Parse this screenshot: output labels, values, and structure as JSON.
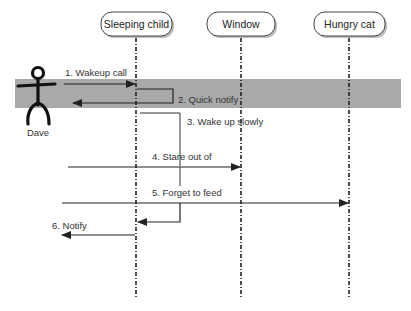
{
  "diagram": {
    "type": "sequence",
    "colors": {
      "band": "#a9a9a9",
      "line": "#222222",
      "text": "#333333",
      "box_border": "#444444",
      "box_shadow": "#bdbdbd"
    },
    "actor": {
      "name": "Dave",
      "icon": "stick-figure-icon"
    },
    "lifelines": [
      {
        "id": "child",
        "label": "Sleeping child"
      },
      {
        "id": "window",
        "label": "Window"
      },
      {
        "id": "cat",
        "label": "Hungry cat"
      }
    ],
    "messages": [
      {
        "n": 1,
        "label": "1. Wakeup call",
        "from": "Dave",
        "to": "Sleeping child"
      },
      {
        "n": 2,
        "label": "2. Quick notify",
        "from": "Sleeping child",
        "to": "Dave"
      },
      {
        "n": 3,
        "label": "3. Wake up slowly",
        "from": "Sleeping child",
        "to": "Sleeping child"
      },
      {
        "n": 4,
        "label": "4. Stare out of",
        "from": "Sleeping child",
        "to": "Window"
      },
      {
        "n": 5,
        "label": "5. Forget to feed",
        "from": "Sleeping child",
        "to": "Hungry cat"
      },
      {
        "n": 6,
        "label": "6. Notify",
        "from": "Sleeping child",
        "to": "Dave"
      }
    ]
  }
}
